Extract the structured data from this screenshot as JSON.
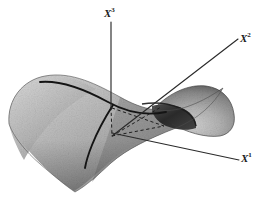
{
  "figure": {
    "background_color": "#ffffff",
    "surface_type": "hyperbolic-paraboloid"
  },
  "axes": [
    {
      "id": "x3",
      "label": "X",
      "superscript": "3",
      "name": "axis-x3",
      "orientation": "vertical-up",
      "line": {
        "x1": 111,
        "y1": 22,
        "x2": 111,
        "y2": 108
      },
      "color": "#2b2b2b",
      "style": "solid"
    },
    {
      "id": "x2",
      "label": "X",
      "superscript": "2",
      "name": "axis-x2",
      "orientation": "diagonal-up-right",
      "line": {
        "x1": 112,
        "y1": 136,
        "x2": 238,
        "y2": 39
      },
      "color": "#2b2b2b",
      "style": "solid"
    },
    {
      "id": "x1",
      "label": "X",
      "superscript": "1",
      "name": "axis-x1",
      "orientation": "diagonal-down-right",
      "line": {
        "x1": 112,
        "y1": 133,
        "x2": 239,
        "y2": 160
      },
      "color": "#2b2b2b",
      "style": "solid"
    }
  ],
  "origin": {
    "x": 111,
    "y": 107,
    "label": "origin"
  },
  "base_point": {
    "x": 112,
    "y": 136,
    "label": "projected-origin"
  },
  "dashed_lines": [
    {
      "name": "drop-line-vertical",
      "x1": 111,
      "y1": 107,
      "x2": 112,
      "y2": 136
    },
    {
      "name": "base-line-horizontal",
      "x1": 112,
      "y1": 136,
      "x2": 163,
      "y2": 125
    },
    {
      "name": "base-line-diagonal",
      "x1": 112,
      "y1": 136,
      "x2": 160,
      "y2": 107
    },
    {
      "name": "base-edge-top",
      "x1": 111,
      "y1": 107,
      "x2": 163,
      "y2": 125
    }
  ],
  "surface_curves": [
    {
      "name": "curve-principal-up",
      "color": "#141414",
      "width": 1.8,
      "note": "upward-curving section through origin running upper-left to right"
    },
    {
      "name": "curve-principal-down",
      "color": "#141414",
      "width": 1.8,
      "note": "downward-curving section through origin running toward lower-left"
    }
  ],
  "colors": {
    "surface_light": "#c9c9c9",
    "surface_mid": "#a6a6a6",
    "surface_dark": "#6f6f6f",
    "underside": "#303030",
    "line": "#2b2b2b",
    "label": "#1a1a1a",
    "background": "#ffffff"
  }
}
